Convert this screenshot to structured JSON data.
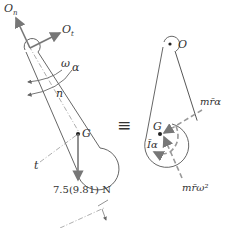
{
  "diagram": {
    "type": "free-body and kinetic diagram of pendulum",
    "left": {
      "labels": {
        "On": "O",
        "On_sub": "n",
        "Ot": "O",
        "Ot_sub": "t",
        "omega": "ω",
        "alpha": "α",
        "n": "n",
        "G": "G",
        "t": "t",
        "weight": "7.5(9.81) N"
      }
    },
    "equivalence": "≡",
    "right": {
      "labels": {
        "O": "O",
        "G": "G",
        "mra": "mr̄α",
        "Ia": "Īα",
        "mrw2": "mr̄ω²"
      }
    },
    "colors": {
      "line": "#555555",
      "arrow": "#777777",
      "dashed": "#999999",
      "text": "#333333"
    }
  }
}
